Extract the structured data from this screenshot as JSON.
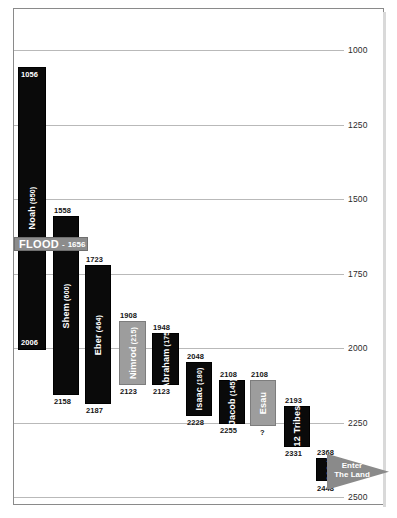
{
  "chart_data": {
    "type": "bar",
    "orientation": "vertical-timeline",
    "title": "",
    "subtitle": "",
    "xlabel": "",
    "ylabel": "",
    "ylim": [
      895,
      2515
    ],
    "y_axis_direction": "increasing-downward",
    "grid": true,
    "legend": "none",
    "yticks": [
      1000,
      1250,
      1500,
      1750,
      2000,
      2250,
      2500
    ],
    "ytick_labels": [
      "1000",
      "1250",
      "1500",
      "1750",
      "2000",
      "2250",
      "2500"
    ],
    "categories": [
      "Noah",
      "Shem",
      "Eber",
      "Nimrod",
      "Abraham",
      "Isaac",
      "Jacob",
      "Esau",
      "12 Tribes",
      "Moses"
    ],
    "series": [
      {
        "name": "Lifespan",
        "values": [
          950,
          600,
          464,
          215,
          175,
          180,
          145,
          null,
          138,
          120
        ]
      }
    ],
    "bars": [
      {
        "name": "Noah",
        "age_label": "(950)",
        "start": 1056,
        "end": 2006,
        "start_label": "1056",
        "end_label": "2006",
        "color": "#0a0a0a",
        "style": "black"
      },
      {
        "name": "Shem",
        "age_label": "(600)",
        "start": 1558,
        "end": 2158,
        "start_label": "1558",
        "end_label": "2158",
        "color": "#0a0a0a",
        "style": "black"
      },
      {
        "name": "Eber",
        "age_label": "(464)",
        "start": 1723,
        "end": 2187,
        "start_label": "1723",
        "end_label": "2187",
        "color": "#0a0a0a",
        "style": "black"
      },
      {
        "name": "Nimrod",
        "age_label": "(215)",
        "start": 1908,
        "end": 2123,
        "start_label": "1908",
        "end_label": "2123",
        "color": "#9d9d9d",
        "style": "gray"
      },
      {
        "name": "Abraham",
        "age_label": "(175)",
        "start": 1948,
        "end": 2123,
        "start_label": "1948",
        "end_label": "2123",
        "color": "#0a0a0a",
        "style": "black"
      },
      {
        "name": "Isaac",
        "age_label": "(180)",
        "start": 2048,
        "end": 2228,
        "start_label": "2048",
        "end_label": "2228",
        "color": "#0a0a0a",
        "style": "black"
      },
      {
        "name": "Jacob",
        "age_label": "(145)",
        "start": 2108,
        "end": 2255,
        "start_label": "2108",
        "end_label": "2255",
        "color": "#0a0a0a",
        "style": "black"
      },
      {
        "name": "Esau",
        "age_label": "",
        "start": 2108,
        "end": 2262,
        "start_label": "2108",
        "end_label": "?",
        "color": "#9d9d9d",
        "style": "gray"
      },
      {
        "name": "12 Tribes",
        "age_label": "",
        "start": 2193,
        "end": 2331,
        "start_label": "2193",
        "end_label": "2331",
        "color": "#0a0a0a",
        "style": "black"
      },
      {
        "name": "Moses",
        "age_label": "(120)",
        "start": 2368,
        "end": 2448,
        "start_label": "2368",
        "end_label": "2448",
        "color": "#0a0a0a",
        "style": "black"
      }
    ],
    "annotations": [
      {
        "name": "flood-banner",
        "word": "FLOOD",
        "separator": "-",
        "year": "1656",
        "value": 1656
      },
      {
        "name": "enter-the-land-arrow",
        "line1": "Enter",
        "line2": "The Land"
      }
    ]
  },
  "colors": {
    "bar_black": "#0a0a0a",
    "bar_gray": "#9d9d9d",
    "flood_gray": "#8c8c8c",
    "arrow_gray": "#8a8a8a",
    "gridline": "#b9b9b9",
    "border": "#8a8a8a",
    "background": "#ffffff",
    "tick_text": "#2b2b2b"
  }
}
